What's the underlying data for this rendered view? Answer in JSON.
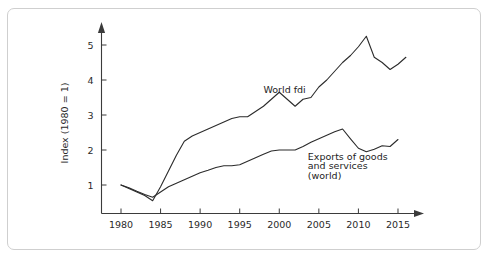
{
  "figure": {
    "background_color": "#ffffff",
    "border_color": "#cfcfcf",
    "line_color": "#2b2b2b"
  },
  "chart_data": {
    "type": "line",
    "title": "",
    "xlabel": "",
    "ylabel": "Index (1980 = 1)",
    "xlim": [
      1979,
      2016.5
    ],
    "ylim": [
      0,
      5.6
    ],
    "grid": false,
    "legend_position": "inline-annotations",
    "xticks": [
      1980,
      1985,
      1990,
      1995,
      2000,
      2005,
      2010,
      2015
    ],
    "xticklabels": [
      "1980",
      "1985",
      "1990",
      "1995",
      "2000",
      "2005",
      "2010",
      "2015"
    ],
    "yticks": [
      1,
      2,
      3,
      4,
      5
    ],
    "yticklabels": [
      "1",
      "2",
      "3",
      "4",
      "5"
    ],
    "annotations": [
      {
        "text": "World fdi",
        "x": 1998.0,
        "y": 3.62,
        "name": "world-fdi-label"
      },
      {
        "text": "Exports of goods",
        "x": 2003.6,
        "y": 1.72,
        "name": "exports-label-line1"
      },
      {
        "text": "and services",
        "x": 2003.6,
        "y": 1.45,
        "name": "exports-label-line2"
      },
      {
        "text": "(world)",
        "x": 2003.6,
        "y": 1.18,
        "name": "exports-label-line3"
      }
    ],
    "series": [
      {
        "name": "World fdi",
        "color": "#2b2b2b",
        "x": [
          1980,
          1981,
          1982,
          1983,
          1984,
          1985,
          1986,
          1987,
          1988,
          1989,
          1990,
          1991,
          1992,
          1993,
          1994,
          1995,
          1996,
          1997,
          1998,
          1999,
          2000,
          2001,
          2002,
          2003,
          2004,
          2005,
          2006,
          2007,
          2008,
          2009,
          2010,
          2011,
          2012,
          2013,
          2014,
          2015,
          2016
        ],
        "values": [
          1.0,
          0.9,
          0.8,
          0.7,
          0.55,
          0.95,
          1.4,
          1.85,
          2.25,
          2.4,
          2.5,
          2.6,
          2.7,
          2.8,
          2.9,
          2.95,
          2.95,
          3.1,
          3.25,
          3.45,
          3.65,
          3.45,
          3.25,
          3.45,
          3.5,
          3.8,
          4.0,
          4.25,
          4.5,
          4.7,
          4.95,
          5.25,
          4.65,
          4.5,
          4.3,
          4.45,
          4.65
        ]
      },
      {
        "name": "Exports of goods and services (world)",
        "color": "#2b2b2b",
        "x": [
          1980,
          1981,
          1982,
          1983,
          1984,
          1985,
          1986,
          1987,
          1988,
          1989,
          1990,
          1991,
          1992,
          1993,
          1994,
          1995,
          1996,
          1997,
          1998,
          1999,
          2000,
          2001,
          2002,
          2003,
          2004,
          2005,
          2006,
          2007,
          2008,
          2009,
          2010,
          2011,
          2012,
          2013,
          2014,
          2015
        ],
        "values": [
          1.0,
          0.92,
          0.82,
          0.73,
          0.65,
          0.8,
          0.95,
          1.05,
          1.15,
          1.25,
          1.35,
          1.42,
          1.5,
          1.55,
          1.55,
          1.58,
          1.68,
          1.78,
          1.88,
          1.97,
          2.0,
          2.0,
          2.0,
          2.1,
          2.22,
          2.32,
          2.42,
          2.52,
          2.6,
          2.32,
          2.05,
          1.95,
          2.02,
          2.12,
          2.1,
          2.3
        ]
      }
    ]
  }
}
